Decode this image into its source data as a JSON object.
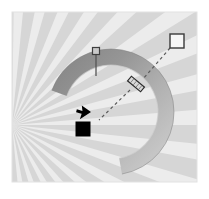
{
  "canvas": {
    "width": 209,
    "height": 199,
    "page_background": "#ffffff"
  },
  "plot_area": {
    "x": 12,
    "y": 12,
    "width": 185,
    "height": 170,
    "background": "#ececec",
    "border_color": "#e4e4e4"
  },
  "colors": {
    "ray_light": "#f4f4f4",
    "ray_dark": "#d6d6d6",
    "arc_dark": "#8f8f8f",
    "arc_mid": "#a8a8a8",
    "arc_light": "#c6c6c6",
    "arc_edge": "#7d7d7d",
    "marker_fill_black": "#000000",
    "marker_fill_white": "#f6f6f6",
    "marker_stroke": "#3a3a3a",
    "dashed_line": "#5a5a5a",
    "handle_fill": "#d9d9d9",
    "handle_stroke": "#2e2e2e"
  },
  "chart_data": {
    "type": "scatter",
    "title": "",
    "subtitle": "",
    "xlabel": "",
    "ylabel": "",
    "grid": false,
    "legend_position": "none",
    "axis_ticks": [],
    "tick_labels": [],
    "annotations": [],
    "background_sunburst": {
      "description": "radial sunburst of alternating light and dark gray wedges",
      "center_x": 12,
      "center_y": 125,
      "ray_count": 18,
      "start_angle_deg": -95,
      "sweep_deg": 190,
      "radius": 260,
      "light_color": "#f4f4f4",
      "dark_color": "#d6d6d6"
    },
    "arc": {
      "description": "thick gray ring segment open toward lower-left",
      "center_x": 111,
      "center_y": 112,
      "outer_radius": 63,
      "inner_radius": 47,
      "start_angle_deg": 200,
      "end_angle_deg": 80,
      "gradient_from": "#8f8f8f",
      "gradient_to": "#c6c6c6"
    },
    "markers": [
      {
        "name": "white-square-marker",
        "shape": "square-outline",
        "x": 177,
        "y": 41,
        "size": 14,
        "fill": "#f6f6f6",
        "stroke": "#3a3a3a"
      },
      {
        "name": "tilted-handle-marker",
        "shape": "rotated-rectangle",
        "x": 136,
        "y": 84,
        "length": 17,
        "thickness": 6,
        "rotation_deg": 40,
        "fill": "#d9d9d9",
        "stroke": "#2e2e2e"
      },
      {
        "name": "pin-marker",
        "shape": "square-on-stem",
        "x": 96,
        "y": 51,
        "size": 7,
        "stem_length": 24,
        "fill": "#c9c9c9",
        "stroke": "#4a4a4a"
      },
      {
        "name": "black-square-marker",
        "shape": "square-filled",
        "x": 83,
        "y": 129,
        "size": 14,
        "fill": "#000000",
        "stroke": "#000000"
      },
      {
        "name": "cursor-arrow",
        "shape": "arrow-pointer",
        "x": 97,
        "y": 121,
        "size": 12,
        "fill": "#000000",
        "rotation_deg": 35
      }
    ],
    "connector_lines": [
      {
        "name": "connector-white-to-handle",
        "from_x": 170,
        "from_y": 48,
        "to_x": 143,
        "to_y": 79,
        "style": "dashed",
        "color": "#5a5a5a",
        "width": 1.2,
        "dash": "3 3"
      },
      {
        "name": "connector-handle-to-cursor",
        "from_x": 130,
        "from_y": 90,
        "to_x": 99,
        "to_y": 120,
        "style": "dashed",
        "color": "#5a5a5a",
        "width": 1.2,
        "dash": "3 3"
      }
    ]
  }
}
